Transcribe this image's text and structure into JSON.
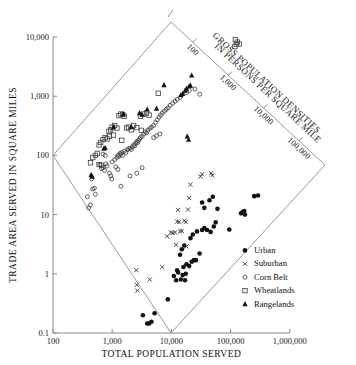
{
  "chart_data": {
    "type": "scatter",
    "title": "",
    "xlabel": "TOTAL POPULATION SERVED",
    "ylabel": "TRADE AREA SERVED IN SQUARE MILES",
    "xscale": "log",
    "yscale": "log",
    "xlim": [
      100,
      1000000
    ],
    "ylim": [
      0.1,
      10000
    ],
    "grid": false,
    "xticks": [
      "100",
      "1,000",
      "10,000",
      "100,000",
      "1,000,000"
    ],
    "xtick_values": [
      100,
      1000,
      10000,
      100000,
      1000000
    ],
    "yticks": [
      "0.1",
      "1",
      "10",
      "100",
      "1,000",
      "10,000"
    ],
    "ytick_values": [
      0.1,
      1,
      10,
      100,
      1000,
      10000
    ],
    "secondary_axis": {
      "title_line1": "GROSS POPULATION DENSITIES",
      "title_line2": "IN PERSONS PER SQUARE MILE",
      "orientation": "diagonal",
      "ticks": [
        "100",
        "1,000",
        "10,000",
        "100,000"
      ],
      "tick_values": [
        100,
        1000,
        10000,
        100000
      ],
      "unit": "persons per square mile"
    },
    "legend": {
      "position": "lower-right",
      "entries": [
        {
          "label": "Urban",
          "marker": "filled-circle"
        },
        {
          "label": "Suburban",
          "marker": "x"
        },
        {
          "label": "Corn Belt",
          "marker": "open-circle"
        },
        {
          "label": "Wheatlands",
          "marker": "open-square"
        },
        {
          "label": "Rangelands",
          "marker": "filled-triangle"
        }
      ]
    },
    "series": [
      {
        "name": "Urban",
        "marker": "filled-circle",
        "points": [
          [
            3300,
            0.2
          ],
          [
            3900,
            0.145
          ],
          [
            4200,
            0.145
          ],
          [
            4600,
            0.155
          ],
          [
            5200,
            0.215
          ],
          [
            8700,
            0.37
          ],
          [
            11000,
            0.92
          ],
          [
            12000,
            0.78
          ],
          [
            12500,
            1.15
          ],
          [
            13000,
            1.05
          ],
          [
            14500,
            0.8
          ],
          [
            15500,
            0.95
          ],
          [
            16000,
            1.3
          ],
          [
            17000,
            0.78
          ],
          [
            17500,
            1.0
          ],
          [
            14000,
            2.1
          ],
          [
            15000,
            2.6
          ],
          [
            16500,
            3.0
          ],
          [
            18000,
            1.45
          ],
          [
            20000,
            1.35
          ],
          [
            22000,
            1.6
          ],
          [
            24000,
            1.7
          ],
          [
            26000,
            1.7
          ],
          [
            21000,
            4.0
          ],
          [
            23000,
            4.6
          ],
          [
            27000,
            5.2
          ],
          [
            30000,
            2.2
          ],
          [
            33000,
            5.5
          ],
          [
            36000,
            5.9
          ],
          [
            40000,
            5.5
          ],
          [
            46000,
            5.1
          ],
          [
            52000,
            6.3
          ],
          [
            56000,
            7.4
          ],
          [
            60000,
            12.5
          ],
          [
            36000,
            13.0
          ],
          [
            33000,
            16.0
          ],
          [
            44000,
            17.5
          ],
          [
            50000,
            20.0
          ],
          [
            150000,
            10.5
          ],
          [
            160000,
            11.0
          ],
          [
            170000,
            11.5
          ],
          [
            175000,
            10.0
          ],
          [
            250000,
            20.5
          ],
          [
            290000,
            21.0
          ],
          [
            95000,
            5.6
          ]
        ]
      },
      {
        "name": "Suburban",
        "marker": "x",
        "points": [
          [
            2550,
            1.15
          ],
          [
            2600,
            0.65
          ],
          [
            2650,
            0.52
          ],
          [
            4300,
            0.8
          ],
          [
            7000,
            1.3
          ],
          [
            8500,
            4.3
          ],
          [
            10500,
            4.9
          ],
          [
            11500,
            5.0
          ],
          [
            12500,
            7.6
          ],
          [
            13500,
            7.5
          ],
          [
            14000,
            5.2
          ],
          [
            15000,
            5.3
          ],
          [
            13000,
            12.0
          ],
          [
            16500,
            7.9
          ],
          [
            17500,
            7.5
          ],
          [
            19000,
            12.2
          ],
          [
            20000,
            19.0
          ],
          [
            21000,
            32.0
          ],
          [
            31000,
            44.0
          ],
          [
            33000,
            48.0
          ],
          [
            47000,
            50.0
          ],
          [
            49000,
            46.0
          ],
          [
            12000,
            3.1
          ],
          [
            18000,
            2.9
          ],
          [
            9800,
            5.0
          ]
        ]
      },
      {
        "name": "Corn Belt",
        "marker": "open-circle",
        "points": [
          [
            380,
            20.0
          ],
          [
            400,
            13.0
          ],
          [
            430,
            14.5
          ],
          [
            450,
            40.0
          ],
          [
            470,
            27.0
          ],
          [
            500,
            28.0
          ],
          [
            520,
            22.0
          ],
          [
            620,
            70.0
          ],
          [
            660,
            60.0
          ],
          [
            700,
            62.0
          ],
          [
            740,
            56.0
          ],
          [
            780,
            72.0
          ],
          [
            820,
            66.0
          ],
          [
            900,
            50.0
          ],
          [
            950,
            45.0
          ],
          [
            1000,
            78.0
          ],
          [
            1100,
            85.0
          ],
          [
            1200,
            92.0
          ],
          [
            1250,
            100.0
          ],
          [
            1300,
            96.0
          ],
          [
            1350,
            108.0
          ],
          [
            1400,
            105.0
          ],
          [
            1450,
            112.0
          ],
          [
            1500,
            100.0
          ],
          [
            1600,
            118.0
          ],
          [
            1700,
            112.0
          ],
          [
            1800,
            124.0
          ],
          [
            1900,
            130.0
          ],
          [
            2000,
            132.0
          ],
          [
            2100,
            126.0
          ],
          [
            2200,
            140.0
          ],
          [
            2300,
            150.0
          ],
          [
            2400,
            145.0
          ],
          [
            2500,
            160.0
          ],
          [
            2600,
            172.0
          ],
          [
            2700,
            165.0
          ],
          [
            2800,
            180.0
          ],
          [
            2900,
            190.0
          ],
          [
            3000,
            200.0
          ],
          [
            3200,
            210.0
          ],
          [
            3400,
            230.0
          ],
          [
            3600,
            250.0
          ],
          [
            3800,
            240.0
          ],
          [
            4000,
            265.0
          ],
          [
            4300,
            285.0
          ],
          [
            4600,
            300.0
          ],
          [
            5000,
            320.0
          ],
          [
            5400,
            360.0
          ],
          [
            5800,
            400.0
          ],
          [
            6200,
            440.0
          ],
          [
            6600,
            480.0
          ],
          [
            7000,
            520.0
          ],
          [
            7600,
            560.0
          ],
          [
            8200,
            600.0
          ],
          [
            8800,
            640.0
          ],
          [
            9500,
            700.0
          ],
          [
            10500,
            760.0
          ],
          [
            11500,
            820.0
          ],
          [
            12500,
            880.0
          ],
          [
            14000,
            950.0
          ],
          [
            18000,
            1150.0
          ],
          [
            20000,
            1250.0
          ],
          [
            25000,
            1320.0
          ],
          [
            30000,
            1080.0
          ],
          [
            1400,
            30.0
          ],
          [
            2000,
            45.0
          ],
          [
            2600,
            50.0
          ],
          [
            3200,
            62.0
          ],
          [
            700,
            105.0
          ],
          [
            760,
            100.0
          ],
          [
            5000,
            200.0
          ],
          [
            5600,
            215.0
          ],
          [
            6400,
            230.0
          ],
          [
            1150,
            64.0
          ],
          [
            1250,
            58.0
          ],
          [
            980,
            40.0
          ]
        ]
      },
      {
        "name": "Wheatlands",
        "marker": "open-square",
        "points": [
          [
            430,
            75.0
          ],
          [
            470,
            92.0
          ],
          [
            520,
            100.0
          ],
          [
            560,
            108.0
          ],
          [
            600,
            150.0
          ],
          [
            640,
            165.0
          ],
          [
            700,
            185.0
          ],
          [
            760,
            200.0
          ],
          [
            820,
            190.0
          ],
          [
            880,
            255.0
          ],
          [
            940,
            270.0
          ],
          [
            1000,
            300.0
          ],
          [
            1100,
            320.0
          ],
          [
            1200,
            290.0
          ],
          [
            1300,
            470.0
          ],
          [
            1400,
            500.0
          ],
          [
            1500,
            490.0
          ],
          [
            1600,
            460.0
          ],
          [
            1750,
            290.0
          ],
          [
            1900,
            300.0
          ],
          [
            2100,
            270.0
          ],
          [
            2300,
            320.0
          ],
          [
            2600,
            295.0
          ],
          [
            3000,
            460.0
          ],
          [
            3400,
            500.0
          ],
          [
            3800,
            520.0
          ],
          [
            4200,
            480.0
          ],
          [
            6000,
            1120.0
          ],
          [
            600,
            70.0
          ],
          [
            660,
            68.0
          ],
          [
            900,
            210.0
          ],
          [
            1050,
            220.0
          ],
          [
            3100,
            265.0
          ],
          [
            1450,
            180.0
          ],
          [
            120000,
            9000.0
          ],
          [
            130000,
            8200.0
          ],
          [
            125000,
            7500.0
          ],
          [
            140000,
            7600.0
          ],
          [
            118000,
            6900.0
          ]
        ]
      },
      {
        "name": "Rangelands",
        "marker": "filled-triangle",
        "points": [
          [
            440,
            47.0
          ],
          [
            460,
            44.0
          ],
          [
            720,
            130.0
          ],
          [
            760,
            135.0
          ],
          [
            1050,
            300.0
          ],
          [
            1550,
            500.0
          ],
          [
            2100,
            305.0
          ],
          [
            2900,
            520.0
          ],
          [
            3200,
            490.0
          ],
          [
            3900,
            600.0
          ],
          [
            5600,
            620.0
          ],
          [
            7500,
            1550.0
          ],
          [
            14500,
            1050.0
          ],
          [
            15500,
            1100.0
          ],
          [
            17000,
            1250.0
          ],
          [
            18000,
            1350.0
          ],
          [
            20000,
            1480.0
          ],
          [
            21000,
            1520.0
          ],
          [
            22000,
            2250.0
          ],
          [
            18500,
            210.0
          ],
          [
            19500,
            185.0
          ]
        ]
      }
    ]
  }
}
